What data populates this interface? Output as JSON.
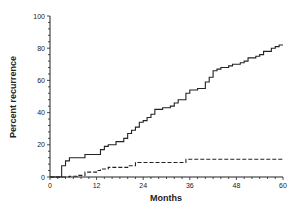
{
  "chart_data": {
    "type": "line",
    "title": "",
    "xlabel": "Months",
    "ylabel": "Percent recurrence",
    "xlim": [
      0,
      60
    ],
    "ylim": [
      0,
      100
    ],
    "xticks": [
      0,
      12,
      24,
      36,
      48,
      60
    ],
    "yticks": [
      0,
      20,
      40,
      60,
      80,
      100
    ],
    "grid": false,
    "legend": null,
    "series": [
      {
        "name": "solid",
        "style": "solid",
        "step": true,
        "points": [
          [
            0,
            0
          ],
          [
            3,
            0
          ],
          [
            3,
            7
          ],
          [
            4,
            10
          ],
          [
            5,
            12
          ],
          [
            9,
            14
          ],
          [
            13,
            17
          ],
          [
            14,
            19
          ],
          [
            15,
            20
          ],
          [
            17,
            22
          ],
          [
            19,
            24
          ],
          [
            20,
            27
          ],
          [
            21,
            29
          ],
          [
            22,
            31
          ],
          [
            23,
            34
          ],
          [
            24,
            35
          ],
          [
            25,
            37
          ],
          [
            26,
            39
          ],
          [
            27,
            42
          ],
          [
            29,
            43
          ],
          [
            31,
            44
          ],
          [
            32,
            46
          ],
          [
            33,
            48
          ],
          [
            35,
            52
          ],
          [
            36,
            54
          ],
          [
            38,
            55
          ],
          [
            40,
            59
          ],
          [
            41,
            62
          ],
          [
            42,
            66
          ],
          [
            43,
            67
          ],
          [
            44,
            68
          ],
          [
            46,
            69
          ],
          [
            47,
            70
          ],
          [
            49,
            71
          ],
          [
            50,
            72
          ],
          [
            51,
            74
          ],
          [
            53,
            75
          ],
          [
            54,
            76
          ],
          [
            55,
            78
          ],
          [
            57,
            80
          ],
          [
            58,
            81
          ],
          [
            59,
            82
          ],
          [
            60,
            82
          ]
        ]
      },
      {
        "name": "dashed",
        "style": "dashed",
        "step": true,
        "points": [
          [
            0,
            0
          ],
          [
            5,
            0
          ],
          [
            5,
            0.5
          ],
          [
            7,
            1
          ],
          [
            9,
            3
          ],
          [
            12,
            4
          ],
          [
            13,
            5
          ],
          [
            15,
            6
          ],
          [
            20,
            7
          ],
          [
            22,
            9
          ],
          [
            35,
            11
          ],
          [
            60,
            11
          ]
        ]
      }
    ]
  }
}
